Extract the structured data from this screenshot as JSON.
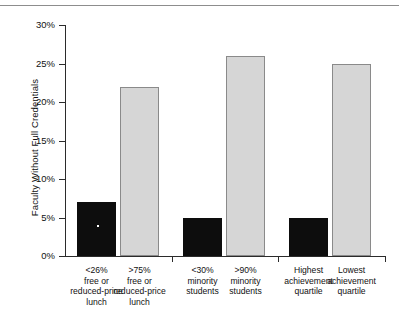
{
  "chart_data": {
    "type": "bar",
    "title": "",
    "xlabel": "",
    "ylabel": "Faculty Without Full Credentials",
    "ylim": [
      0,
      30
    ],
    "grid": false,
    "legend": null,
    "y_ticks": [
      "0%",
      "5%",
      "10%",
      "15%",
      "20%",
      "25%",
      "30%"
    ],
    "y_tick_values": [
      0,
      5,
      10,
      15,
      20,
      25,
      30
    ],
    "categories": [
      "<26% free or reduced-price lunch",
      ">75% free or reduced-price lunch",
      "<30% minority students",
      ">90% minority students",
      "Highest achievement quartile",
      "Lowest achievement quartile"
    ],
    "category_lines": [
      [
        "<26%",
        "free or",
        "reduced-price",
        "lunch"
      ],
      [
        ">75%",
        "free or",
        "reduced-price",
        "lunch"
      ],
      [
        "<30%",
        "minority",
        "students"
      ],
      [
        ">90%",
        "minority",
        "students"
      ],
      [
        "Highest",
        "achievement",
        "quartile"
      ],
      [
        "Lowest",
        "achievement",
        "quartile"
      ]
    ],
    "values": [
      7,
      22,
      5,
      26,
      5,
      25
    ],
    "bar_colors": [
      "#0d0d0d",
      "#d6d6d6",
      "#0d0d0d",
      "#d6d6d6",
      "#0d0d0d",
      "#d6d6d6"
    ]
  },
  "colors": {
    "dark_bar": "#0d0d0d",
    "light_bar": "#d6d6d6",
    "light_bar_outline": "#8a8a8a",
    "axis": "#2b2b2b",
    "rule": "#8d8d8d",
    "text": "#111111",
    "background": "#ffffff"
  }
}
